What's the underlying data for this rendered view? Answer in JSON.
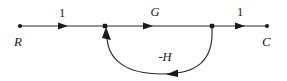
{
  "diagram": {
    "type": "signal-flow-graph",
    "title": "",
    "background_color": "#ffffff",
    "line_color": "#2a2a2a",
    "text_color": "#1a1a1a",
    "nodes": [
      {
        "id": "R",
        "label": "R",
        "x": 20,
        "y": 26,
        "role": "input-node"
      },
      {
        "id": "sum",
        "label": "",
        "x": 105,
        "y": 26,
        "role": "summing-node"
      },
      {
        "id": "pickoff",
        "label": "",
        "x": 212,
        "y": 26,
        "role": "pickoff-node"
      },
      {
        "id": "C",
        "label": "C",
        "x": 267,
        "y": 26,
        "role": "output-node"
      }
    ],
    "branches": [
      {
        "id": "b1",
        "from": "R",
        "to": "sum",
        "gain": "1",
        "gain_x": 62,
        "gain_y": 17,
        "direction": "forward"
      },
      {
        "id": "b2",
        "from": "sum",
        "to": "pickoff",
        "gain": "G",
        "gain_x": 155,
        "gain_y": 16,
        "direction": "forward"
      },
      {
        "id": "b3",
        "from": "pickoff",
        "to": "C",
        "gain": "1",
        "gain_x": 240,
        "gain_y": 16,
        "direction": "forward"
      },
      {
        "id": "b4",
        "from": "pickoff",
        "to": "sum",
        "gain": "-H",
        "gain_x": 165,
        "gain_y": 61,
        "direction": "feedback"
      }
    ],
    "labels": {
      "input": "R",
      "output": "C",
      "forward_gain": "G",
      "feedback_gain": "-H",
      "unity_left": "1",
      "unity_right": "1"
    }
  }
}
